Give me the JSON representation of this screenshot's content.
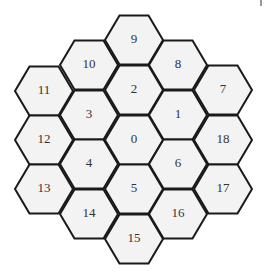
{
  "diagram": {
    "type": "hexagonal-cell-layout",
    "hex": {
      "radius": 29,
      "fill": "#f3f3f3",
      "stroke": "#1a1a1a"
    },
    "cells": [
      {
        "label": "9",
        "cx": 134,
        "cy": 40
      },
      {
        "label": "10",
        "cx": 89,
        "cy": 65
      },
      {
        "label": "8",
        "cx": 178,
        "cy": 65
      },
      {
        "label": "11",
        "cx": 44,
        "cy": 91
      },
      {
        "label": "2",
        "cx": 134,
        "cy": 90
      },
      {
        "label": "7",
        "cx": 223,
        "cy": 90
      },
      {
        "label": "3",
        "cx": 89,
        "cy": 115
      },
      {
        "label": "1",
        "cx": 178,
        "cy": 115
      },
      {
        "label": "12",
        "cx": 44,
        "cy": 140
      },
      {
        "label": "0",
        "cx": 134,
        "cy": 140
      },
      {
        "label": "18",
        "cx": 223,
        "cy": 140
      },
      {
        "label": "4",
        "cx": 89,
        "cy": 164
      },
      {
        "label": "6",
        "cx": 178,
        "cy": 164
      },
      {
        "label": "13",
        "cx": 44,
        "cy": 189
      },
      {
        "label": "5",
        "cx": 134,
        "cy": 189
      },
      {
        "label": "17",
        "cx": 223,
        "cy": 189
      },
      {
        "label": "14",
        "cx": 89,
        "cy": 214
      },
      {
        "label": "16",
        "cx": 178,
        "cy": 214
      },
      {
        "label": "15",
        "cx": 134,
        "cy": 239
      }
    ]
  }
}
